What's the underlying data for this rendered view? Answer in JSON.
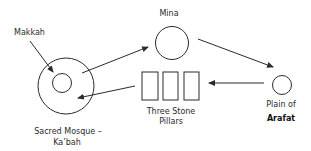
{
  "diagram": {
    "colors": {
      "stroke": "#2b2b2b",
      "background": "#ffffff",
      "text": "#2a2a2a"
    },
    "nodes": {
      "makkah": {
        "label": "Makkah"
      },
      "sacred_mosque": {
        "label_line1": "Sacred Mosque –",
        "label_line2": "Ka’bah"
      },
      "mina": {
        "label": "Mina"
      },
      "arafat": {
        "label_line1": "Plain of",
        "label_line2": "Arafat"
      },
      "pillars": {
        "label_line1": "Three Stone",
        "label_line2": "Pillars",
        "count": 3
      }
    },
    "edges": [
      {
        "from": "Makkah",
        "to": "Sacred Mosque – Ka’bah",
        "type": "pointer"
      },
      {
        "from": "Sacred Mosque – Ka’bah",
        "to": "Mina",
        "type": "arrow"
      },
      {
        "from": "Mina",
        "to": "Plain of Arafat",
        "type": "arrow"
      },
      {
        "from": "Plain of Arafat",
        "to": "Three Stone Pillars",
        "type": "arrow"
      },
      {
        "from": "Three Stone Pillars",
        "to": "Sacred Mosque – Ka’bah",
        "type": "arrow"
      }
    ]
  }
}
